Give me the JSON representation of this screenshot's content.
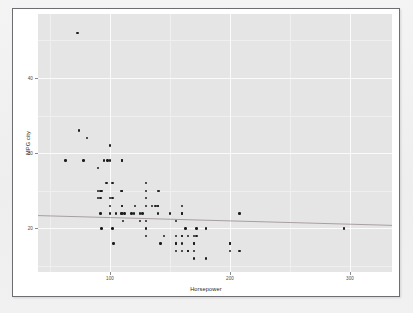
{
  "figure": {
    "background": "#ffffff",
    "panel_fill": "#e5e5e5",
    "border_color": "#6e6e72",
    "point_color": "#1d1d1d",
    "fit_line_color": "#8c7f82"
  },
  "chart_data": {
    "type": "scatter",
    "title": "",
    "xlabel": "Horsepower",
    "ylabel": "MPG city",
    "xlim": [
      40,
      335
    ],
    "ylim": [
      14.2,
      48.5
    ],
    "xticks": [
      100,
      200,
      300
    ],
    "xticklabels": [
      "100",
      "200",
      "300"
    ],
    "yticks": [
      20,
      30,
      40
    ],
    "yticklabels": [
      "20",
      "30",
      "40"
    ],
    "grid": true,
    "legend": false,
    "x": [
      140,
      200,
      172,
      172,
      208,
      110,
      170,
      180,
      145,
      170,
      200,
      295,
      170,
      165,
      170,
      165,
      155,
      110,
      160,
      110,
      160,
      165,
      155,
      100,
      74,
      110,
      160,
      140,
      100,
      92,
      81,
      92,
      103,
      93,
      102,
      130,
      73,
      90,
      102,
      109,
      150,
      100,
      141,
      160,
      127,
      130,
      100,
      90,
      110,
      130,
      160,
      125,
      110,
      130,
      155,
      138,
      160,
      130,
      200,
      180,
      208,
      130,
      105,
      92,
      63,
      121,
      135,
      98,
      120,
      111,
      155,
      125,
      110,
      90,
      93,
      140,
      160,
      170,
      97,
      100,
      130,
      165,
      140,
      110,
      118,
      95,
      102,
      112,
      78,
      163,
      155,
      142,
      109
    ],
    "y": [
      25,
      18,
      20,
      19,
      22,
      22,
      19,
      16,
      19,
      16,
      17,
      20,
      18,
      17,
      18,
      17,
      18,
      23,
      19,
      23,
      22,
      19,
      19,
      24,
      33,
      25,
      23,
      22,
      29,
      22,
      32,
      25,
      18,
      20,
      24,
      26,
      46,
      28,
      20,
      22,
      22,
      22,
      25,
      17,
      22,
      19,
      23,
      25,
      22,
      21,
      22,
      21,
      29,
      25,
      17,
      23,
      19,
      20,
      18,
      20,
      17,
      23,
      22,
      24,
      29,
      23,
      23,
      29,
      22,
      21,
      21,
      22,
      29,
      24,
      25,
      23,
      18,
      17,
      26,
      31,
      24,
      17,
      23,
      25,
      22,
      29,
      26,
      22,
      29,
      20,
      18,
      18,
      25
    ],
    "fit": {
      "type": "linear",
      "x0": 40,
      "y0": 21.7,
      "x1": 335,
      "y1": 20.4
    },
    "n_points": 93
  }
}
